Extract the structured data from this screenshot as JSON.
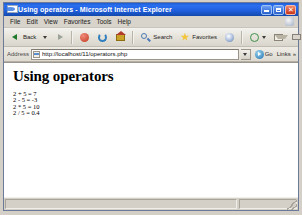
{
  "window": {
    "title": "Using operators - Microsoft Internet Explorer",
    "icon": "ie-page-icon",
    "minimize_label": "_",
    "maximize_label": "□",
    "close_label": "✕"
  },
  "menu": {
    "items": [
      {
        "label": "File"
      },
      {
        "label": "Edit"
      },
      {
        "label": "View"
      },
      {
        "label": "Favorites"
      },
      {
        "label": "Tools"
      },
      {
        "label": "Help"
      }
    ]
  },
  "toolbar": {
    "back_label": "Back",
    "buttons": [
      {
        "name": "back-button",
        "label": "Back",
        "icon": "arrow-left-icon"
      },
      {
        "name": "back-dropdown",
        "label": "",
        "icon": "chevron-down-icon"
      },
      {
        "name": "forward-button",
        "label": "",
        "icon": "arrow-right-icon"
      },
      {
        "name": "stop-button",
        "label": "",
        "icon": "stop-icon"
      },
      {
        "name": "refresh-button",
        "label": "",
        "icon": "refresh-icon"
      },
      {
        "name": "home-button",
        "label": "",
        "icon": "home-icon"
      },
      {
        "name": "search-button",
        "label": "Search",
        "icon": "search-icon"
      },
      {
        "name": "favorites-button",
        "label": "Favorites",
        "icon": "star-icon"
      },
      {
        "name": "media-button",
        "label": "",
        "icon": "media-icon"
      },
      {
        "name": "history-button",
        "label": "",
        "icon": "history-icon"
      },
      {
        "name": "mail-button",
        "label": "",
        "icon": "mail-icon"
      },
      {
        "name": "print-button",
        "label": "",
        "icon": "print-icon"
      },
      {
        "name": "edit-button",
        "label": "",
        "icon": "edit-icon"
      },
      {
        "name": "discuss-button",
        "label": "",
        "icon": "discuss-icon"
      },
      {
        "name": "messenger-button",
        "label": "",
        "icon": "messenger-icon"
      },
      {
        "name": "research-button",
        "label": "",
        "icon": "research-icon"
      }
    ]
  },
  "address": {
    "label": "Address",
    "url": "http://localhost/11/operators.php",
    "placeholder": "",
    "go_label": "Go",
    "links_label": "Links",
    "links_chevron": "»"
  },
  "page": {
    "heading": "Using operators",
    "expressions": [
      {
        "text": "2 + 5 = 7"
      },
      {
        "text": "2 - 5 = -3"
      },
      {
        "text": "2 * 5 = 10"
      },
      {
        "text": "2 / 5 = 0.4"
      }
    ]
  },
  "status": {
    "text": "",
    "zone": ""
  }
}
